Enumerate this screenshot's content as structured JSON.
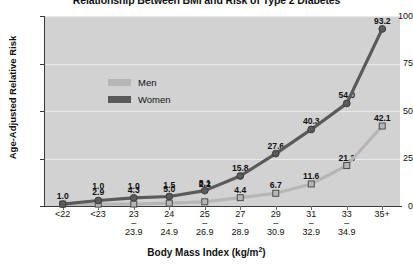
{
  "chart_data": {
    "type": "line",
    "title": "Relationship Between BMI and Risk of Type 2 Diabetes",
    "xlabel": "Body Mass Index (kg/m",
    "xlabel_sup": "2",
    "xlabel_suffix": ")",
    "ylabel": "Age-Adjusted Relative Risk",
    "categories": [
      "<22",
      "<23",
      "23–23.9",
      "24–24.9",
      "25–26.9",
      "27–28.9",
      "29–30.9",
      "31–32.9",
      "33–34.9",
      "35+"
    ],
    "category_lines": [
      {
        "top": "<22",
        "dash": "",
        "bottom": ""
      },
      {
        "top": "<23",
        "dash": "",
        "bottom": ""
      },
      {
        "top": "23",
        "dash": "–",
        "bottom": "23.9"
      },
      {
        "top": "24",
        "dash": "–",
        "bottom": "24.9"
      },
      {
        "top": "25",
        "dash": "–",
        "bottom": "26.9"
      },
      {
        "top": "27",
        "dash": "–",
        "bottom": "28.9"
      },
      {
        "top": "29",
        "dash": "–",
        "bottom": "30.9"
      },
      {
        "top": "31",
        "dash": "–",
        "bottom": "32.9"
      },
      {
        "top": "33",
        "dash": "–",
        "bottom": "34.9"
      },
      {
        "top": "35+",
        "dash": "",
        "bottom": ""
      }
    ],
    "ylim": [
      0,
      100
    ],
    "yticks": [
      0,
      25,
      50,
      75,
      100
    ],
    "ytick_labels": [
      "0",
      "25",
      "50",
      "75",
      "100"
    ],
    "grid": true,
    "legend_position": "upper-left-inside",
    "series": [
      {
        "name": "Men",
        "color": "#b6b6b6",
        "marker": "square",
        "values": [
          1.0,
          1.0,
          1.0,
          1.5,
          2.2,
          4.4,
          6.7,
          11.6,
          21.3,
          42.1
        ],
        "labels": [
          "1.0",
          "1.0",
          "1.0",
          "1.5",
          "2.2",
          "4.4",
          "6.7",
          "11.6",
          "21.3",
          "42.1"
        ]
      },
      {
        "name": "Women",
        "color": "#5a5a5a",
        "marker": "circle",
        "values": [
          1.0,
          2.9,
          4.3,
          5.0,
          8.1,
          15.8,
          27.6,
          40.3,
          54.0,
          93.2
        ],
        "labels": [
          "1.0",
          "2.9",
          "4.3",
          "5.0",
          "8.1",
          "15.8",
          "27.6",
          "40.3",
          "54.0",
          "93.2"
        ]
      }
    ]
  },
  "legend": {
    "items": [
      {
        "label": "Men",
        "color": "#b6b6b6"
      },
      {
        "label": "Women",
        "color": "#5a5a5a"
      }
    ]
  },
  "colors": {
    "plot_background": "#d2d2d2",
    "gridline": "#e9e9e9",
    "axis": "#3b3b3b",
    "men": "#b6b6b6",
    "women": "#5a5a5a",
    "text": "#111111"
  }
}
